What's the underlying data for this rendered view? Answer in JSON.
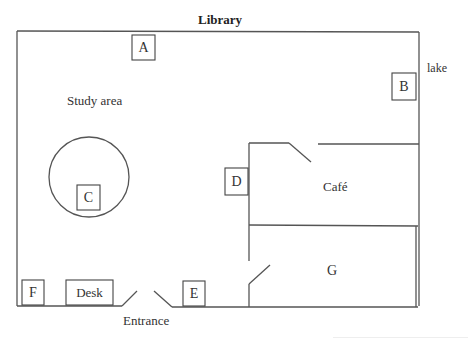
{
  "diagram": {
    "title": "Library",
    "type": "floor-plan",
    "areas": {
      "study_area": "Study area",
      "cafe": "Café",
      "room_g": "G",
      "entrance": "Entrance",
      "lake": "lake"
    },
    "markers": {
      "A": "A",
      "B": "B",
      "C": "C",
      "D": "D",
      "E": "E",
      "F": "F",
      "desk": "Desk"
    },
    "colors": {
      "line": "#555555",
      "text": "#333333",
      "background": "#ffffff"
    }
  }
}
